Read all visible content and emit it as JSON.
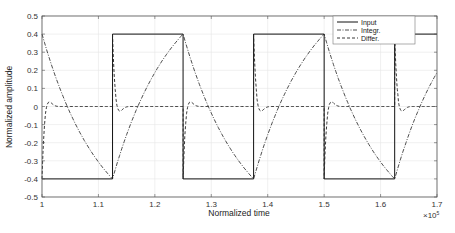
{
  "chart_data": {
    "type": "line",
    "title": "",
    "xlabel": "Normalized time",
    "ylabel": "Normalized amplitude",
    "x_multiplier": "×10^5",
    "x_multiplier_base": "×10",
    "x_multiplier_exp": "5",
    "xlim": [
      1.0,
      1.7
    ],
    "ylim": [
      -0.5,
      0.5
    ],
    "xticks": [
      "1",
      "1.1",
      "1.2",
      "1.3",
      "1.4",
      "1.5",
      "1.6",
      "1.7"
    ],
    "yticks": [
      "0.5",
      "0.4",
      "0.3",
      "0.2",
      "0.1",
      "0",
      "-0.1",
      "-0.2",
      "-0.3",
      "-0.4",
      "-0.5"
    ],
    "grid": true,
    "legend_position": "top-right",
    "legend": [
      "Input",
      "Integr.",
      "Differ."
    ],
    "period": 0.25,
    "transitions_x": [
      1.125,
      1.25,
      1.375,
      1.5,
      1.625
    ],
    "series": [
      {
        "name": "Input",
        "style": "solid",
        "description": "square wave ±0.4",
        "x": [
          1.0,
          1.125,
          1.125,
          1.25,
          1.25,
          1.375,
          1.375,
          1.5,
          1.5,
          1.625,
          1.625,
          1.7
        ],
        "y": [
          -0.4,
          -0.4,
          0.4,
          0.4,
          -0.4,
          -0.4,
          0.4,
          0.4,
          -0.4,
          -0.4,
          0.4,
          0.4
        ]
      },
      {
        "name": "Integr.",
        "style": "dash-dot",
        "description": "triangle-like wave ±0.4, peaks at transitions",
        "x": [
          1.0,
          1.125,
          1.25,
          1.375,
          1.5,
          1.625,
          1.7
        ],
        "y": [
          0.4,
          -0.4,
          0.4,
          -0.4,
          0.4,
          -0.4,
          0.18
        ]
      },
      {
        "name": "Differ.",
        "style": "dashed",
        "description": "spikes ±0.4 at each transition decaying to 0 with small overshoot",
        "spike_x": [
          1.0,
          1.125,
          1.25,
          1.375,
          1.5,
          1.625
        ],
        "spike_y": [
          -0.4,
          0.4,
          -0.4,
          0.4,
          -0.4,
          0.4
        ],
        "overshoot": 0.02
      }
    ]
  }
}
